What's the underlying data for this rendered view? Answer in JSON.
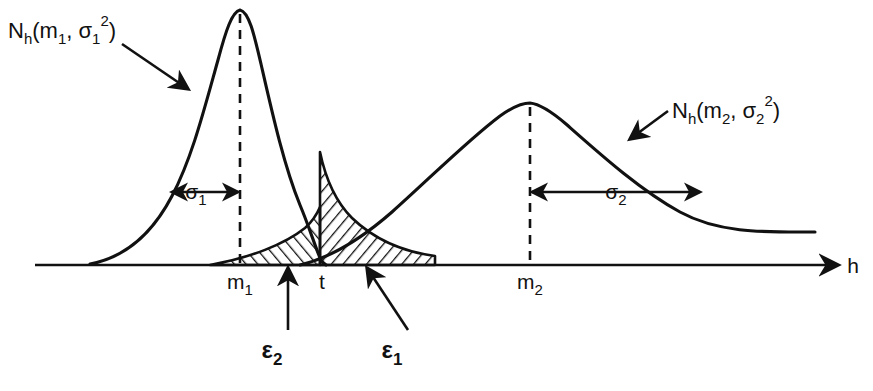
{
  "figure": {
    "type": "diagram",
    "title_visible": false,
    "background_color": "#ffffff",
    "ink_color": "#111111",
    "axis": {
      "variable_label": "h",
      "arrow_direction": "right",
      "y_pixel": 265,
      "x_start_pixel": 35,
      "x_end_pixel": 845
    },
    "curves": [
      {
        "id": "curve1",
        "label_base": "N",
        "label_sub": "h",
        "label_args_open": "(m",
        "label_args_sub1": "1",
        "label_args_mid": ", σ",
        "label_args_sub2": "1",
        "label_args_sup": "2",
        "label_args_close": ")",
        "label_full": "N_h(m_1, σ_1^2)",
        "mean_label": "m",
        "mean_sub": "1",
        "sigma_label": "σ",
        "sigma_sub": "1",
        "peak_x": 240,
        "peak_y": 10,
        "mean_x": 240,
        "sigma_px": 70,
        "narrow": true
      },
      {
        "id": "curve2",
        "label_base": "N",
        "label_sub": "h",
        "label_args_open": "(m",
        "label_args_sub1": "2",
        "label_args_mid": ", σ",
        "label_args_sub2": "2",
        "label_args_sup": "2",
        "label_args_close": ")",
        "label_full": "N_h(m_2, σ_2^2)",
        "mean_label": "m",
        "mean_sub": "2",
        "sigma_label": "σ",
        "sigma_sub": "2",
        "peak_x": 530,
        "peak_y": 103,
        "mean_x": 530,
        "sigma_px": 160,
        "narrow": false
      }
    ],
    "threshold": {
      "label": "t",
      "x": 320,
      "description": "decision threshold between the two distributions"
    },
    "error_regions": [
      {
        "id": "eps2",
        "label": "ε",
        "sub": "2",
        "hatch_direction": "up-right",
        "side": "left-of-threshold",
        "label_x": 272,
        "label_y": 358
      },
      {
        "id": "eps1",
        "label": "ε",
        "sub": "1",
        "hatch_direction": "down-right",
        "side": "right-of-threshold",
        "label_x": 392,
        "label_y": 358
      }
    ],
    "annotations": {
      "sigma1_arrow": "double-headed arrow from curve-1 left flank to the dashed mean line m1",
      "sigma2_arrow": "double-headed arrow from the dashed mean line m2 to curve-2 right flank",
      "curve1_leader": "arrow from N_h(m1,σ1^2) label down-right to curve 1",
      "curve2_leader": "arrow from N_h(m2,σ2^2) label down-left to curve 2",
      "eps2_leader": "arrow from ε2 label up to the left hatched area",
      "eps1_leader": "arrow from ε1 label up to the right hatched area"
    }
  }
}
